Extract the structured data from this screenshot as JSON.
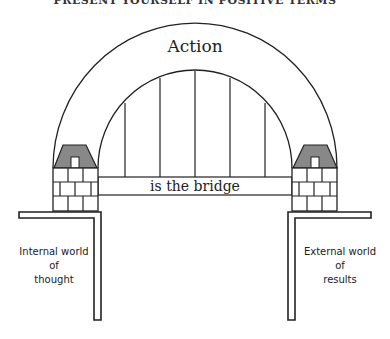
{
  "header": {
    "title": "PRESENT YOURSELF IN POSITIVE TERMS"
  },
  "diagram": {
    "arch_label": "Action",
    "bridge_label": "is the bridge",
    "left_label": {
      "lines": [
        "Internal world",
        "of",
        "thought"
      ]
    },
    "right_label": {
      "lines": [
        "External world",
        "of",
        "results"
      ]
    },
    "colors": {
      "stroke": "#222222",
      "cap_fill": "#888888",
      "background": "#ffffff"
    }
  }
}
